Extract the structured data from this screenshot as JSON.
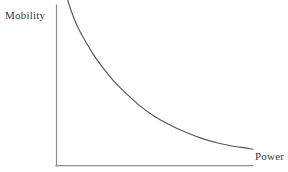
{
  "chart_data": {
    "type": "line",
    "title": "",
    "subtitle": "",
    "xlabel": "Power",
    "ylabel": "Mobility",
    "legend": [],
    "legend_position": "none",
    "grid": false,
    "axis_ticks": [],
    "xlim": [
      0,
      1
    ],
    "ylim": [
      0,
      1
    ],
    "annotations": [],
    "series": [
      {
        "name": "mobility-power-tradeoff",
        "color": "#555555",
        "x": [
          0.055,
          0.075,
          0.105,
          0.14,
          0.19,
          0.245,
          0.3,
          0.36,
          0.425,
          0.5,
          0.575,
          0.655,
          0.735,
          0.82,
          0.9,
          0.96,
          1.0
        ],
        "y": [
          1.02,
          0.945,
          0.855,
          0.775,
          0.675,
          0.585,
          0.505,
          0.435,
          0.365,
          0.3,
          0.25,
          0.205,
          0.168,
          0.138,
          0.118,
          0.108,
          0.1
        ]
      }
    ]
  },
  "axes": {
    "y_axis_label": "Mobility",
    "x_axis_label": "Power",
    "line_color": "#8d8d8d",
    "curve_color": "#555555",
    "background_color": "#ffffff"
  }
}
